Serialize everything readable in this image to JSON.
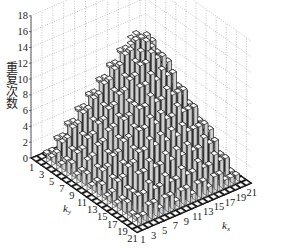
{
  "chart_data": {
    "type": "bar3d",
    "title": "",
    "zlabel": "重复次数",
    "xlabel": "k",
    "xlabel_sub": "x",
    "ylabel": "k",
    "ylabel_sub": "y",
    "x_ticks": [
      "1",
      "3",
      "5",
      "7",
      "9",
      "11",
      "13",
      "15",
      "17",
      "19",
      "21"
    ],
    "y_ticks": [
      "1",
      "3",
      "5",
      "7",
      "9",
      "11",
      "13",
      "15",
      "17",
      "19",
      "21"
    ],
    "z_ticks": [
      "0",
      "2",
      "4",
      "6",
      "8",
      "10",
      "12",
      "14",
      "16",
      "18"
    ],
    "zlim": [
      0,
      18
    ],
    "grid": true,
    "x": [
      1,
      2,
      3,
      4,
      5,
      6,
      7,
      8,
      9,
      10,
      11,
      12,
      13,
      14,
      15,
      16,
      17,
      18,
      19,
      20,
      21
    ],
    "y": [
      1,
      2,
      3,
      4,
      5,
      6,
      7,
      8,
      9,
      10,
      11,
      12,
      13,
      14,
      15,
      16,
      17,
      18,
      19,
      20,
      21
    ],
    "values": [
      [
        0,
        0,
        0,
        0,
        0,
        0,
        0,
        0,
        0,
        0,
        0,
        0,
        0,
        0,
        0,
        0,
        0,
        0,
        0,
        0,
        0
      ],
      [
        0,
        1,
        1,
        2,
        1,
        2,
        2,
        1,
        2,
        2,
        1,
        2,
        2,
        1,
        2,
        1,
        2,
        2,
        1,
        1,
        0
      ],
      [
        0,
        1,
        3,
        3,
        4,
        3,
        3,
        4,
        3,
        4,
        3,
        3,
        4,
        3,
        3,
        4,
        3,
        3,
        3,
        1,
        0
      ],
      [
        0,
        2,
        3,
        5,
        5,
        6,
        5,
        5,
        6,
        5,
        6,
        5,
        5,
        6,
        5,
        5,
        6,
        5,
        3,
        2,
        0
      ],
      [
        0,
        1,
        4,
        5,
        7,
        7,
        8,
        7,
        7,
        8,
        7,
        8,
        7,
        7,
        8,
        7,
        7,
        5,
        4,
        1,
        0
      ],
      [
        0,
        2,
        3,
        6,
        7,
        9,
        9,
        10,
        9,
        9,
        10,
        9,
        9,
        10,
        9,
        9,
        7,
        6,
        3,
        2,
        0
      ],
      [
        0,
        2,
        3,
        5,
        8,
        9,
        11,
        11,
        12,
        11,
        11,
        12,
        11,
        11,
        11,
        9,
        8,
        5,
        3,
        2,
        0
      ],
      [
        0,
        1,
        4,
        5,
        7,
        10,
        11,
        13,
        13,
        14,
        13,
        13,
        14,
        13,
        11,
        10,
        7,
        5,
        4,
        1,
        0
      ],
      [
        0,
        2,
        3,
        6,
        7,
        9,
        12,
        13,
        15,
        15,
        16,
        15,
        15,
        13,
        12,
        9,
        7,
        6,
        3,
        2,
        0
      ],
      [
        0,
        2,
        4,
        5,
        8,
        9,
        11,
        14,
        15,
        16,
        17,
        16,
        15,
        14,
        11,
        9,
        8,
        5,
        4,
        2,
        0
      ],
      [
        0,
        1,
        3,
        6,
        7,
        10,
        11,
        13,
        16,
        17,
        17,
        17,
        16,
        13,
        11,
        10,
        7,
        6,
        3,
        1,
        0
      ],
      [
        0,
        2,
        3,
        5,
        8,
        9,
        12,
        13,
        15,
        16,
        17,
        16,
        15,
        13,
        12,
        9,
        8,
        5,
        3,
        2,
        0
      ],
      [
        0,
        2,
        4,
        5,
        7,
        9,
        11,
        14,
        15,
        15,
        16,
        15,
        15,
        14,
        11,
        9,
        7,
        5,
        4,
        2,
        0
      ],
      [
        0,
        1,
        3,
        6,
        7,
        10,
        11,
        13,
        13,
        14,
        13,
        14,
        13,
        13,
        11,
        10,
        7,
        6,
        3,
        1,
        0
      ],
      [
        0,
        2,
        3,
        5,
        8,
        9,
        11,
        11,
        12,
        11,
        11,
        12,
        11,
        11,
        11,
        9,
        8,
        5,
        3,
        2,
        0
      ],
      [
        0,
        1,
        4,
        5,
        7,
        9,
        9,
        10,
        9,
        10,
        9,
        9,
        10,
        9,
        9,
        9,
        7,
        5,
        4,
        1,
        0
      ],
      [
        0,
        2,
        3,
        6,
        7,
        7,
        8,
        7,
        8,
        7,
        8,
        7,
        8,
        7,
        7,
        7,
        7,
        6,
        3,
        2,
        0
      ],
      [
        0,
        2,
        3,
        5,
        5,
        6,
        5,
        5,
        6,
        5,
        6,
        5,
        6,
        5,
        5,
        6,
        5,
        5,
        3,
        2,
        0
      ],
      [
        0,
        1,
        3,
        3,
        4,
        3,
        3,
        4,
        3,
        3,
        4,
        3,
        3,
        4,
        3,
        3,
        4,
        3,
        3,
        1,
        0
      ],
      [
        0,
        1,
        1,
        2,
        2,
        1,
        2,
        2,
        1,
        2,
        2,
        1,
        2,
        2,
        1,
        2,
        2,
        1,
        1,
        1,
        0
      ],
      [
        0,
        0,
        0,
        0,
        0,
        0,
        0,
        0,
        0,
        0,
        0,
        0,
        0,
        0,
        0,
        0,
        0,
        0,
        0,
        0,
        0
      ]
    ]
  }
}
